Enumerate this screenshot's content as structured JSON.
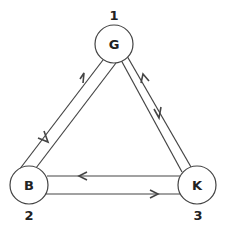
{
  "diagram": {
    "type": "directed-graph",
    "stroke_color": "#444444",
    "nodes": [
      {
        "id": "G",
        "label": "G",
        "number": "1",
        "cx": 114,
        "cy": 44,
        "r": 19
      },
      {
        "id": "B",
        "label": "B",
        "number": "2",
        "cx": 29,
        "cy": 185,
        "r": 19
      },
      {
        "id": "K",
        "label": "K",
        "number": "3",
        "cx": 197,
        "cy": 185,
        "r": 19
      }
    ],
    "edges": [
      {
        "from": "G",
        "to": "B"
      },
      {
        "from": "B",
        "to": "G"
      },
      {
        "from": "G",
        "to": "K"
      },
      {
        "from": "K",
        "to": "G"
      },
      {
        "from": "K",
        "to": "B"
      },
      {
        "from": "B",
        "to": "K"
      }
    ]
  }
}
